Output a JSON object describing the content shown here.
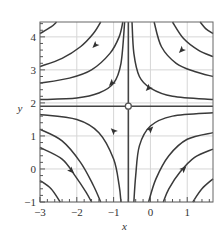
{
  "chart_data": {
    "type": "line",
    "title": "",
    "subtitle": "",
    "xlabel": "x",
    "ylabel": "y",
    "xlim": [
      -3,
      1.7
    ],
    "ylim": [
      -1,
      4.45
    ],
    "grid": true,
    "legend": null,
    "x_ticks": [
      -3,
      -2,
      -1,
      0,
      1
    ],
    "x_tick_labels": [
      "−3",
      "−2",
      "−1",
      "0",
      "1"
    ],
    "y_ticks": [
      -1,
      0,
      1,
      2,
      3,
      4
    ],
    "y_tick_labels": [
      "−1",
      "0",
      "1",
      "2",
      "3",
      "4"
    ],
    "fixed_point": {
      "x": -0.6,
      "y": 1.9,
      "kind": "saddle"
    },
    "separatrices": [
      {
        "name": "horizontal",
        "y": 1.9
      },
      {
        "name": "vertical",
        "x": -0.6
      }
    ],
    "series": [
      {
        "name": "upper-left-1",
        "quadrant": "upper-left",
        "points": [
          [
            -3,
            4.1
          ],
          [
            -2.7,
            4.3
          ],
          [
            -2.55,
            4.45
          ]
        ]
      },
      {
        "name": "upper-left-2",
        "quadrant": "upper-left",
        "points": [
          [
            -3,
            3.1
          ],
          [
            -2.4,
            3.35
          ],
          [
            -1.9,
            3.7
          ],
          [
            -1.55,
            4.1
          ],
          [
            -1.35,
            4.45
          ]
        ]
      },
      {
        "name": "upper-left-3",
        "quadrant": "upper-left",
        "points": [
          [
            -3,
            2.6
          ],
          [
            -2.2,
            2.75
          ],
          [
            -1.6,
            3.0
          ],
          [
            -1.1,
            3.5
          ],
          [
            -0.85,
            4.0
          ],
          [
            -0.75,
            4.45
          ]
        ]
      },
      {
        "name": "upper-left-4",
        "quadrant": "upper-left",
        "points": [
          [
            -3,
            2.1
          ],
          [
            -2.0,
            2.15
          ],
          [
            -1.4,
            2.3
          ],
          [
            -1.0,
            2.6
          ],
          [
            -0.8,
            3.2
          ],
          [
            -0.7,
            4.45
          ]
        ]
      },
      {
        "name": "upper-right-1",
        "quadrant": "upper-right",
        "points": [
          [
            -0.5,
            4.45
          ],
          [
            -0.45,
            3.5
          ],
          [
            -0.3,
            2.8
          ],
          [
            0.0,
            2.45
          ],
          [
            0.6,
            2.2
          ],
          [
            1.7,
            2.1
          ]
        ]
      },
      {
        "name": "upper-right-2",
        "quadrant": "upper-right",
        "points": [
          [
            0.1,
            4.45
          ],
          [
            0.3,
            3.7
          ],
          [
            0.7,
            3.2
          ],
          [
            1.2,
            2.95
          ],
          [
            1.7,
            2.8
          ]
        ]
      },
      {
        "name": "upper-right-3",
        "quadrant": "upper-right",
        "points": [
          [
            0.6,
            4.45
          ],
          [
            0.9,
            3.95
          ],
          [
            1.3,
            3.6
          ],
          [
            1.7,
            3.4
          ]
        ]
      },
      {
        "name": "upper-right-4",
        "quadrant": "upper-right",
        "points": [
          [
            1.35,
            4.45
          ],
          [
            1.5,
            4.25
          ],
          [
            1.7,
            4.1
          ]
        ]
      },
      {
        "name": "lower-left-1",
        "quadrant": "lower-left",
        "points": [
          [
            -3,
            1.65
          ],
          [
            -2.0,
            1.5
          ],
          [
            -1.4,
            1.1
          ],
          [
            -1.0,
            0.3
          ],
          [
            -0.85,
            -0.5
          ],
          [
            -0.8,
            -1
          ]
        ]
      },
      {
        "name": "lower-left-2",
        "quadrant": "lower-left",
        "points": [
          [
            -3,
            1.2
          ],
          [
            -2.4,
            0.85
          ],
          [
            -1.9,
            0.2
          ],
          [
            -1.55,
            -0.5
          ],
          [
            -1.35,
            -1
          ]
        ]
      },
      {
        "name": "lower-left-3",
        "quadrant": "lower-left",
        "points": [
          [
            -3,
            0.65
          ],
          [
            -2.4,
            0.3
          ],
          [
            -2.05,
            -0.2
          ],
          [
            -1.75,
            -0.7
          ],
          [
            -1.6,
            -1
          ]
        ]
      },
      {
        "name": "lower-left-4",
        "quadrant": "lower-left",
        "points": [
          [
            -3,
            -0.35
          ],
          [
            -2.7,
            -0.6
          ],
          [
            -2.45,
            -1
          ]
        ]
      },
      {
        "name": "lower-right-1",
        "quadrant": "lower-right",
        "points": [
          [
            1.7,
            1.7
          ],
          [
            0.6,
            1.6
          ],
          [
            0.0,
            1.3
          ],
          [
            -0.3,
            0.7
          ],
          [
            -0.4,
            -0.2
          ],
          [
            -0.45,
            -1
          ]
        ]
      },
      {
        "name": "lower-right-2",
        "quadrant": "lower-right",
        "points": [
          [
            1.7,
            1.1
          ],
          [
            1.0,
            0.9
          ],
          [
            0.5,
            0.4
          ],
          [
            0.15,
            -0.3
          ],
          [
            -0.05,
            -1
          ]
        ]
      },
      {
        "name": "lower-right-3",
        "quadrant": "lower-right",
        "points": [
          [
            1.7,
            0.6
          ],
          [
            1.2,
            0.35
          ],
          [
            0.8,
            -0.1
          ],
          [
            0.5,
            -0.6
          ],
          [
            0.35,
            -1
          ]
        ]
      },
      {
        "name": "lower-right-4",
        "quadrant": "lower-right",
        "points": [
          [
            1.7,
            -0.3
          ],
          [
            1.4,
            -0.6
          ],
          [
            1.15,
            -1
          ]
        ]
      }
    ],
    "arrows": [
      {
        "x": -1.5,
        "y": 3.75,
        "dir": "down-left"
      },
      {
        "x": -1.05,
        "y": 2.6,
        "dir": "down-left"
      },
      {
        "x": 0.85,
        "y": 3.6,
        "dir": "down-left"
      },
      {
        "x": -0.05,
        "y": 2.45,
        "dir": "down-left"
      },
      {
        "x": -2.15,
        "y": -0.05,
        "dir": "down-right"
      },
      {
        "x": -1.0,
        "y": 1.15,
        "dir": "up-left"
      },
      {
        "x": 0.0,
        "y": 1.2,
        "dir": "up-right"
      },
      {
        "x": 0.9,
        "y": 0.0,
        "dir": "up-right"
      }
    ]
  }
}
